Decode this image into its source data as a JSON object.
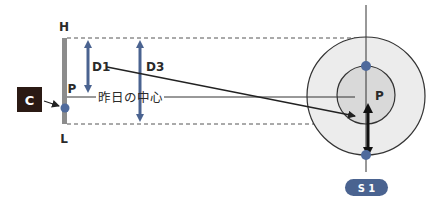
{
  "diagram": {
    "labels": {
      "high": "H",
      "low": "L",
      "point_left": "P",
      "point_right": "P",
      "d1": "D1",
      "d3": "D3",
      "yesterday_center": "昨日の中心",
      "c_box": "C",
      "s1_badge": "S 1"
    },
    "colors": {
      "accent_blue": "#4a6390",
      "dot_blue": "#4f6a9c",
      "dark_box": "#2b1a14",
      "gray_bar": "#8c8c8c",
      "outer_circle_fill": "#ececec",
      "inner_circle_fill": "#d9d9d9",
      "line": "#222222"
    }
  }
}
